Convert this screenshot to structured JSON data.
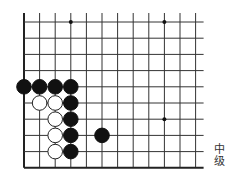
{
  "diagram": {
    "type": "go-board-problem",
    "grid": {
      "origin_x": 24,
      "origin_y": 22,
      "spacing_x": 15.6,
      "spacing_y": 16.2,
      "cols": 12,
      "rows": 10,
      "top_extension": 9,
      "right_extension": 8,
      "edges": {
        "left": "board-edge",
        "bottom": "board-edge",
        "top": "open",
        "right": "open"
      },
      "line_color": "#333333",
      "edge_color": "#222222"
    },
    "star_points": [
      {
        "col": 3,
        "row": 0
      },
      {
        "col": 9,
        "row": 0
      },
      {
        "col": 9,
        "row": 6
      }
    ],
    "stones": [
      {
        "color": "black",
        "col": 0,
        "row": 4
      },
      {
        "color": "black",
        "col": 1,
        "row": 4
      },
      {
        "color": "black",
        "col": 2,
        "row": 4
      },
      {
        "color": "black",
        "col": 3,
        "row": 4
      },
      {
        "color": "white",
        "col": 1,
        "row": 5
      },
      {
        "color": "white",
        "col": 2,
        "row": 5
      },
      {
        "color": "black",
        "col": 3,
        "row": 5
      },
      {
        "color": "white",
        "col": 2,
        "row": 6
      },
      {
        "color": "black",
        "col": 3,
        "row": 6
      },
      {
        "color": "white",
        "col": 2,
        "row": 7
      },
      {
        "color": "black",
        "col": 3,
        "row": 7
      },
      {
        "color": "black",
        "col": 5,
        "row": 7
      },
      {
        "color": "white",
        "col": 2,
        "row": 8
      },
      {
        "color": "black",
        "col": 3,
        "row": 8
      }
    ],
    "colors": {
      "black_stone": "#111111",
      "white_stone_fill": "#ffffff",
      "white_stone_stroke": "#222222",
      "background": "#ffffff"
    }
  },
  "level_label": {
    "char1": "中",
    "char2": "级"
  }
}
